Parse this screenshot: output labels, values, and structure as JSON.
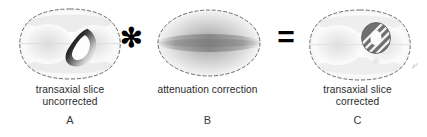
{
  "figure": {
    "background_color": "#ffffff"
  },
  "operators": {
    "multiply": "✻",
    "equals": "=",
    "multiply_name": "multiplication-asterisk",
    "equals_name": "equals-sign"
  },
  "panels": [
    {
      "id": "A",
      "letter": "A",
      "caption": "transaxial slice\nuncorrected",
      "caption_line1": "transaxial slice",
      "caption_line2": "uncorrected",
      "image_kind": "emission-slice-uncorrected",
      "outline": "dashed body contour, peanut shaped",
      "features": [
        "left lung field",
        "right lung field",
        "myocardial crescent, dark, non-uniform"
      ],
      "myocardium_appearance": "dark crescent with steep intensity gradient"
    },
    {
      "id": "B",
      "letter": "B",
      "caption": "attenuation correction",
      "caption_line1": "attenuation correction",
      "caption_line2": "",
      "image_kind": "attenuation-correction-map",
      "outline": "dashed elliptical contour",
      "features": [
        "radial grayscale gradient",
        "dark horizontal central band"
      ],
      "myocardium_appearance": "not applicable"
    },
    {
      "id": "C",
      "letter": "C",
      "caption": "transaxial slice\ncorrected",
      "caption_line1": "transaxial slice",
      "caption_line2": "corrected",
      "image_kind": "emission-slice-corrected",
      "outline": "dashed body contour, peanut shaped",
      "features": [
        "left lung field",
        "right lung field",
        "myocardial ring, uniform gray with hatching",
        "faint artifact marks at lower right"
      ],
      "myocardium_appearance": "uniform gray ring with diagonal hatch stripes"
    }
  ],
  "colors": {
    "ink": "#2a2a2a",
    "outline_dash": "#5a5a5a",
    "tissue_light": "#ededed",
    "myocardium_dark": "#1a1a1a",
    "myocardium_gray": "#6e6e6e",
    "attenuation_dark": "#8f8f8f"
  }
}
